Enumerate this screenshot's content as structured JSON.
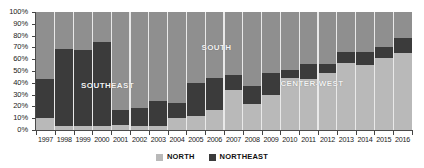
{
  "chart_data": {
    "type": "bar",
    "title": "",
    "subtitle": "",
    "xlabel": "",
    "ylabel": "",
    "stacked": true,
    "normalized_percent": true,
    "grid": false,
    "legend_position": "bottom",
    "ylim": [
      0,
      100
    ],
    "ytick_labels": [
      "0%",
      "10%",
      "20%",
      "30%",
      "40%",
      "50%",
      "60%",
      "70%",
      "80%",
      "90%",
      "100%"
    ],
    "ytick_values": [
      0,
      10,
      20,
      30,
      40,
      50,
      60,
      70,
      80,
      90,
      100
    ],
    "categories": [
      "1997",
      "1998",
      "1999",
      "2000",
      "2001",
      "2002",
      "2003",
      "2004",
      "2005",
      "2006",
      "2007",
      "2008",
      "2009",
      "2010",
      "2011",
      "2012",
      "2013",
      "2014",
      "2015",
      "2016"
    ],
    "series": [
      {
        "name": "NORTH",
        "color": "#b9b9b9",
        "values": [
          10,
          3,
          3,
          3,
          4,
          3,
          3,
          10,
          12,
          17,
          34,
          22,
          30,
          44,
          43,
          48,
          57,
          55,
          61,
          65
        ]
      },
      {
        "name": "NORTHEAST",
        "color": "#3b3b3b",
        "values": [
          33,
          66,
          65,
          72,
          13,
          16,
          22,
          13,
          28,
          27,
          13,
          15,
          18,
          7,
          13,
          8,
          9,
          11,
          9,
          13
        ]
      },
      {
        "name": "OTHER REGIONS",
        "color": "#8f8f8f",
        "values": [
          57,
          31,
          32,
          25,
          83,
          81,
          75,
          77,
          60,
          56,
          53,
          63,
          52,
          49,
          44,
          44,
          34,
          34,
          30,
          22
        ]
      }
    ],
    "annotations": [
      {
        "text": "SOUTHEAST",
        "x_pct": 12,
        "y_pct": 38
      },
      {
        "text": "SOUTH",
        "x_pct": 44,
        "y_pct": 70
      },
      {
        "text": "CENTER-WEST",
        "x_pct": 65,
        "y_pct": 40
      }
    ]
  },
  "legend": {
    "items": [
      {
        "label": "NORTH",
        "color": "#b9b9b9"
      },
      {
        "label": "NORTHEAST",
        "color": "#3b3b3b"
      }
    ]
  }
}
